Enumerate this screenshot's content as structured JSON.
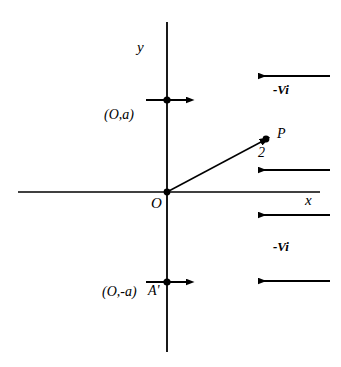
{
  "figure": {
    "background_color": "#ffffff",
    "stroke_color": "#000000",
    "width": 341,
    "height": 367
  },
  "axes": {
    "x_label": "x",
    "y_label": "y",
    "origin_label": "O",
    "x_axis": {
      "x1": 18,
      "y1": 192,
      "x2": 320,
      "y2": 192
    },
    "y_axis": {
      "x1": 167,
      "y1": 22,
      "x2": 167,
      "y2": 352
    }
  },
  "points": [
    {
      "name": "point-a",
      "label": "(O,a)",
      "x": 167,
      "y": 100,
      "marker": "filled-dot",
      "arrow": {
        "direction": "right",
        "x1": 145,
        "y1": 100,
        "x2": 190,
        "y2": 100
      }
    },
    {
      "name": "point-a-prime",
      "label": "(O,-a)",
      "secondary_label": "A'",
      "x": 167,
      "y": 282,
      "marker": "filled-dot",
      "arrow": {
        "direction": "right",
        "x1": 145,
        "y1": 282,
        "x2": 190,
        "y2": 282
      }
    },
    {
      "name": "point-p",
      "label": "P",
      "x": 266,
      "y": 139,
      "marker": "filled-dot"
    }
  ],
  "vector": {
    "name": "position-vector",
    "label": "2",
    "from": {
      "x": 167,
      "y": 192
    },
    "to": {
      "x": 266,
      "y": 139
    },
    "arrowhead": true
  },
  "flow_arrows": {
    "label": "-Vi",
    "direction": "left",
    "items": [
      {
        "x_start": 330,
        "x_end": 256,
        "y": 76
      },
      {
        "x_start": 330,
        "x_end": 256,
        "y": 170
      },
      {
        "x_start": 330,
        "x_end": 256,
        "y": 215
      },
      {
        "x_start": 330,
        "x_end": 256,
        "y": 281
      }
    ],
    "label_top": "-Vi",
    "label_bottom": "-Vi"
  }
}
